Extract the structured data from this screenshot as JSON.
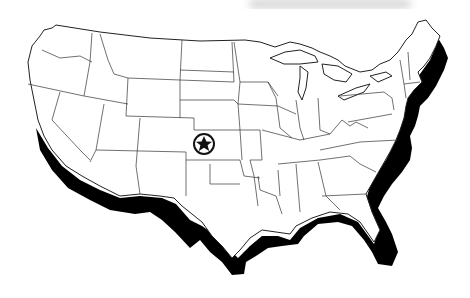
{
  "map": {
    "subject": "United States (contiguous 48 states) outline map",
    "style": "black and white line art with drop shadow along south and east coasts",
    "marker": {
      "icon": "star-in-circle-icon",
      "location": "Kansas (geographic center)",
      "x": 204,
      "y": 144
    },
    "colors": {
      "outline": "#222222",
      "fill": "#ffffff",
      "shadow": "#000000",
      "background": "#ffffff"
    }
  }
}
